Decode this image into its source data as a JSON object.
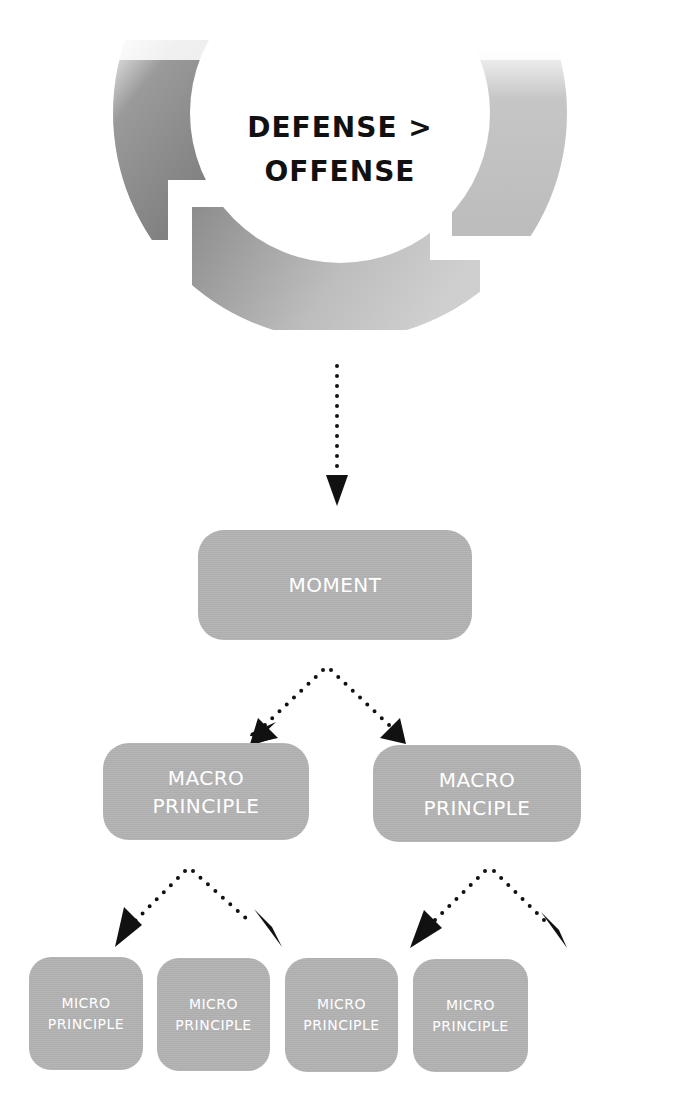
{
  "cycle": {
    "line1": "DEFENSE >",
    "line2": "OFFENSE",
    "ring_color_dark": "#7d7d7d",
    "ring_color_light": "#c4c4c4"
  },
  "connector_color": "#111111",
  "node_color": "#b3b3b3",
  "node_text_color": "#ffffff",
  "hierarchy": {
    "moment": {
      "label": "MOMENT"
    },
    "macro": [
      {
        "line1": "MACRO",
        "line2": "PRINCIPLE"
      },
      {
        "line1": "MACRO",
        "line2": "PRINCIPLE"
      }
    ],
    "micro": [
      {
        "line1": "MICRO",
        "line2": "PRINCIPLE"
      },
      {
        "line1": "MICRO",
        "line2": "PRINCIPLE"
      },
      {
        "line1": "MICRO",
        "line2": "PRINCIPLE"
      },
      {
        "line1": "MICRO",
        "line2": "PRINCIPLE"
      }
    ]
  }
}
